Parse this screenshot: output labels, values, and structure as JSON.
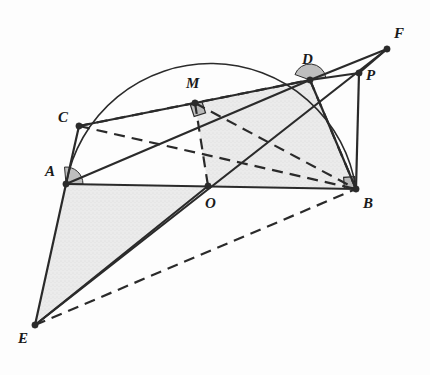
{
  "figure": {
    "canvas": {
      "width": 430,
      "height": 375,
      "background": "#fdfdfd"
    },
    "style": {
      "stroke_color": "#2b2b2b",
      "stroke_width": 2.2,
      "thin_stroke_width": 1.5,
      "arc_stroke_width": 1.6,
      "dash_pattern": "11,7",
      "shade_fill": "#d9d9d9",
      "shade_opacity": 0.55,
      "angle_mark_fill": "#a8a8a8",
      "point_fill": "#2b2b2b",
      "point_radius": 3.2,
      "label_color": "#1a1a1a",
      "label_font_size": 15
    },
    "points": [
      {
        "id": "A",
        "label": "A",
        "x": 66,
        "y": 184,
        "lx": 45,
        "ly": 164,
        "dot": true
      },
      {
        "id": "B",
        "label": "B",
        "x": 356,
        "y": 189,
        "lx": 363,
        "ly": 196,
        "dot": true
      },
      {
        "id": "C",
        "label": "C",
        "x": 79,
        "y": 126,
        "lx": 58,
        "ly": 110,
        "dot": true
      },
      {
        "id": "D",
        "label": "D",
        "x": 310,
        "y": 80,
        "lx": 302,
        "ly": 52,
        "dot": true
      },
      {
        "id": "E",
        "label": "E",
        "x": 35,
        "y": 325,
        "lx": 18,
        "ly": 331,
        "dot": true
      },
      {
        "id": "F",
        "label": "F",
        "x": 387,
        "y": 49,
        "lx": 394,
        "ly": 26,
        "dot": true
      },
      {
        "id": "M",
        "label": "M",
        "x": 195,
        "y": 103,
        "lx": 186,
        "ly": 76,
        "dot": true
      },
      {
        "id": "O",
        "label": "O",
        "x": 208,
        "y": 186,
        "lx": 205,
        "ly": 196,
        "dot": true
      },
      {
        "id": "P",
        "label": "P",
        "x": 359,
        "y": 73,
        "lx": 366,
        "ly": 68,
        "dot": true
      }
    ],
    "arc": {
      "name": "semicircle-on-AB",
      "center_x": 208,
      "center_y": 186,
      "radius": 147,
      "from": "A",
      "to": "B",
      "description": "upper semicircle with diameter AB passing through C and D"
    },
    "solid_segments": [
      {
        "name": "segment-A-B",
        "from": "A",
        "to": "B"
      },
      {
        "name": "segment-A-C",
        "from": "A",
        "to": "C"
      },
      {
        "name": "segment-A-D",
        "from": "A",
        "to": "D"
      },
      {
        "name": "segment-A-E",
        "from": "A",
        "to": "E"
      },
      {
        "name": "segment-C-M",
        "from": "C",
        "to": "M"
      },
      {
        "name": "segment-M-D",
        "from": "M",
        "to": "D"
      },
      {
        "name": "segment-D-F",
        "from": "D",
        "to": "F"
      },
      {
        "name": "segment-D-P",
        "from": "D",
        "to": "P"
      },
      {
        "name": "segment-D-B",
        "from": "D",
        "to": "B"
      },
      {
        "name": "segment-P-B",
        "from": "P",
        "to": "B"
      },
      {
        "name": "segment-P-F",
        "from": "P",
        "to": "F"
      },
      {
        "name": "segment-E-O",
        "from": "E",
        "to": "O"
      },
      {
        "name": "segment-E-F",
        "from": "E",
        "to": "F"
      }
    ],
    "dashed_segments": [
      {
        "name": "segment-C-B-dashed",
        "from": "C",
        "to": "B"
      },
      {
        "name": "segment-C-D-dashed-lower",
        "from": "C",
        "to": "D"
      },
      {
        "name": "segment-M-O-dashed",
        "from": "M",
        "to": "O"
      },
      {
        "name": "segment-M-B-dashed",
        "from": "M",
        "to": "B"
      },
      {
        "name": "segment-D-B-dashed",
        "from": "D",
        "to": "B"
      },
      {
        "name": "segment-E-B-dashed",
        "from": "E",
        "to": "B"
      }
    ],
    "shaded_regions": [
      {
        "name": "region-A-E-O",
        "vertices": [
          "A",
          "E",
          "O"
        ]
      },
      {
        "name": "region-M-D-B-O",
        "vertices": [
          "M",
          "D",
          "B",
          "O"
        ]
      }
    ],
    "angle_marks": [
      {
        "name": "right-angle-at-A",
        "at": "A",
        "type": "sector",
        "start_deg": 0,
        "end_deg": 95,
        "radius": 17
      },
      {
        "name": "right-angle-at-B",
        "at": "B",
        "type": "square",
        "size": 11,
        "rot_deg": -4,
        "dx": -12,
        "dy": -12
      },
      {
        "name": "right-angle-at-M",
        "at": "M",
        "type": "square",
        "size": 12,
        "rot_deg": -18,
        "dx": -3,
        "dy": 0
      },
      {
        "name": "right-angle-at-D",
        "at": "D",
        "type": "sector",
        "start_deg": 10,
        "end_deg": 160,
        "radius": 16
      }
    ]
  }
}
